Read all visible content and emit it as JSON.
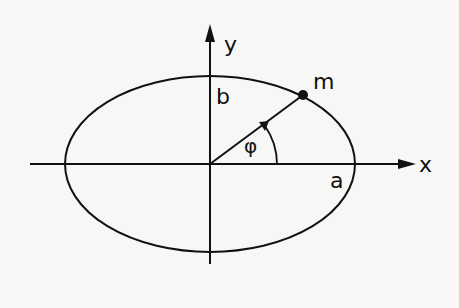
{
  "figure": {
    "type": "ellipse-diagram",
    "background": "#f7f7f5",
    "stroke_color": "#111111",
    "labels": {
      "x_axis": "x",
      "y_axis": "y",
      "semi_minor": "b",
      "semi_major": "a",
      "point": "m",
      "angle": "φ"
    },
    "geometry": {
      "origin": [
        210,
        164
      ],
      "semi_major_px": 145,
      "semi_minor_px": 88,
      "point_m": [
        303,
        95
      ],
      "angle_arc_radius_px": 65
    }
  }
}
